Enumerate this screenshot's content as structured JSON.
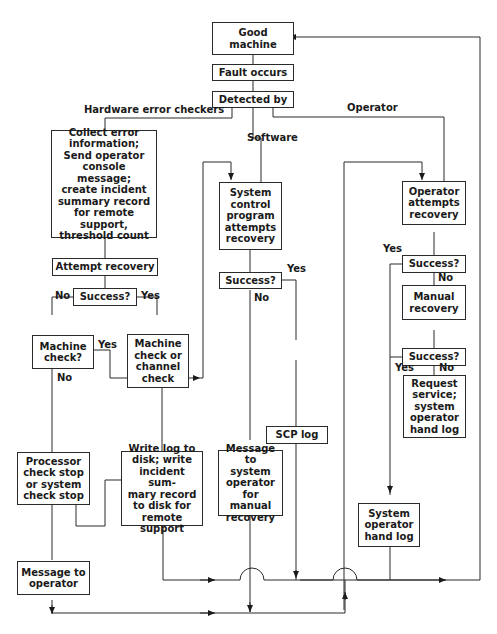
{
  "diagram": {
    "type": "flowchart",
    "nodes": {
      "good_machine": "Good machine",
      "fault_occurs": "Fault occurs",
      "detected_by": "Detected by",
      "collect_error": "Collect error\ninformation;\nSend operator\nconsole message;\ncreate incident\nsummary record\nfor remote support,\nthreshold count",
      "attempt_recovery": "Attempt recovery",
      "success_hw": "Success?",
      "machine_check_q": "Machine\ncheck?",
      "machine_or_channel_check": "Machine\ncheck or\nchannel\ncheck",
      "processor_check_stop": "Processor\ncheck stop\nor system\ncheck stop",
      "write_log": "Write log to\ndisk; write\nincident sum-\nmary record\nto disk for\nremote support",
      "message_to_operator": "Message to\noperator",
      "scp_attempts": "System\ncontrol\nprogram\nattempts\nrecovery",
      "success_sw": "Success?",
      "scp_log": "SCP log",
      "message_to_sysop": "Message to\nsystem\noperator\nfor manual\nrecovery",
      "operator_attempts": "Operator\nattempts\nrecovery",
      "success_op1": "Success?",
      "manual_recovery": "Manual\nrecovery",
      "success_op2": "Success?",
      "request_service": "Request\nservice;\nsystem\noperator\nhand log",
      "sysop_hand_log": "System\noperator\nhand log"
    },
    "edge_labels": {
      "hardware": "Hardware error checkers",
      "software": "Software",
      "operator": "Operator",
      "hw_no": "No",
      "hw_yes": "Yes",
      "mc_yes": "Yes",
      "mc_no": "No",
      "sw_yes": "Yes",
      "sw_no": "No",
      "op1_yes": "Yes",
      "op1_no": "No",
      "op2_yes": "Yes",
      "op2_no": "No"
    }
  }
}
